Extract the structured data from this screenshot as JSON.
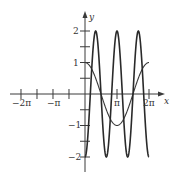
{
  "chart_data": {
    "type": "line",
    "title": "",
    "xlabel": "x",
    "ylabel": "y",
    "xlim": [
      -6.9,
      7.5
    ],
    "ylim": [
      -2.4,
      2.6
    ],
    "grid": false,
    "legend": null,
    "x_ticks": [
      {
        "value": -6.2832,
        "label": "−2π"
      },
      {
        "value": -4.7124,
        "label": ""
      },
      {
        "value": -3.1416,
        "label": "−π"
      },
      {
        "value": -1.5708,
        "label": ""
      },
      {
        "value": 3.1416,
        "label": "π"
      },
      {
        "value": 6.2832,
        "label": "2π"
      }
    ],
    "y_ticks": [
      {
        "value": 2,
        "label": "2"
      },
      {
        "value": 1.5,
        "label": ""
      },
      {
        "value": 1,
        "label": "1"
      },
      {
        "value": 0.5,
        "label": ""
      },
      {
        "value": -0.5,
        "label": ""
      },
      {
        "value": -1,
        "label": "−1"
      },
      {
        "value": -1.5,
        "label": ""
      },
      {
        "value": -2,
        "label": "−2"
      }
    ],
    "series": [
      {
        "name": "y = cos x",
        "expression": "cos(x)",
        "domain": [
          0,
          6.2832
        ],
        "style": "thin",
        "x": [
          0,
          0.5236,
          1.0472,
          1.5708,
          2.0944,
          2.618,
          3.1416,
          3.6652,
          4.1888,
          4.7124,
          5.236,
          5.7596,
          6.2832
        ],
        "values": [
          1,
          0.87,
          0.5,
          0,
          -0.5,
          -0.87,
          -1,
          -0.87,
          -0.5,
          0,
          0.5,
          0.87,
          1
        ]
      },
      {
        "name": "y = -2 cos 3x",
        "expression": "-2*cos(3*x)",
        "domain": [
          0,
          6.2832
        ],
        "style": "thick",
        "x": [
          0,
          0.5236,
          1.0472,
          1.5708,
          2.0944,
          2.618,
          3.1416,
          3.6652,
          4.1888,
          4.7124,
          5.236,
          5.7596,
          6.2832
        ],
        "values": [
          -2,
          0,
          2,
          0,
          -2,
          0,
          2,
          0,
          -2,
          0,
          2,
          0,
          -2
        ]
      }
    ]
  },
  "labels": {
    "x_axis": "x",
    "y_axis": "y",
    "x_neg_2pi": "−2π",
    "x_neg_pi": "−π",
    "x_pi": "π",
    "x_2pi": "2π",
    "y_2": "2",
    "y_1": "1",
    "y_neg1": "−1",
    "y_neg2": "−2"
  }
}
